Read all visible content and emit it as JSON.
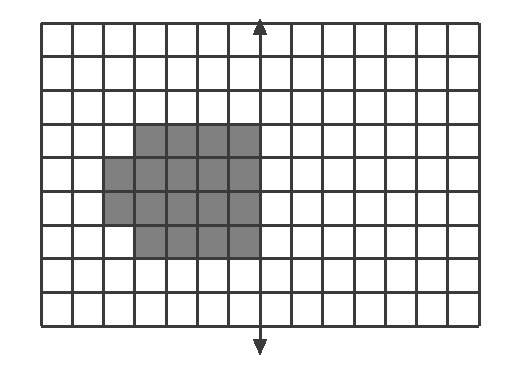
{
  "figure": {
    "caption_fragment": "",
    "grid": {
      "columns": 14,
      "rows": 9,
      "cell_width": 31.3,
      "cell_height": 33.7,
      "origin_x": 41,
      "origin_y": 23,
      "line_color": "#3a3a3a",
      "line_width": 3,
      "background_color": "#ffffff"
    },
    "shaded": {
      "fill_color": "#808080",
      "label": "shaded-region",
      "cells": [
        {
          "col": 3,
          "row": 3
        },
        {
          "col": 4,
          "row": 3
        },
        {
          "col": 5,
          "row": 3
        },
        {
          "col": 6,
          "row": 3
        },
        {
          "col": 2,
          "row": 4
        },
        {
          "col": 3,
          "row": 4
        },
        {
          "col": 4,
          "row": 4
        },
        {
          "col": 5,
          "row": 4
        },
        {
          "col": 6,
          "row": 4
        },
        {
          "col": 2,
          "row": 5
        },
        {
          "col": 3,
          "row": 5
        },
        {
          "col": 4,
          "row": 5
        },
        {
          "col": 5,
          "row": 5
        },
        {
          "col": 6,
          "row": 5
        },
        {
          "col": 3,
          "row": 6
        },
        {
          "col": 4,
          "row": 6
        },
        {
          "col": 5,
          "row": 6
        },
        {
          "col": 6,
          "row": 6
        }
      ],
      "cell_count": 18
    },
    "axis": {
      "label": "vertical-axis",
      "column_index": 7,
      "x": 260,
      "top_y": 18,
      "bottom_y": 356,
      "color": "#3a3a3a",
      "stroke_width": 3,
      "arrow_up": {
        "name": "arrow-up",
        "tip_y": 18
      },
      "arrow_down": {
        "name": "arrow-down",
        "tip_y": 356
      }
    }
  },
  "chart_data": {
    "type": "heatmap",
    "xlabel": "",
    "ylabel": "",
    "columns": 14,
    "rows": 9,
    "xlim": [
      0,
      14
    ],
    "ylim": [
      0,
      9
    ],
    "grid": true,
    "legend": "none",
    "colors": {
      "shaded": "#808080",
      "unshaded": "#ffffff",
      "gridline": "#3a3a3a"
    },
    "annotations": [
      {
        "type": "arrow",
        "name": "vertical-axis-arrow",
        "x": 7,
        "y0": 9.2,
        "y1": -0.4,
        "double_headed": true
      }
    ],
    "values": [
      [
        0,
        0,
        0,
        0,
        0,
        0,
        0,
        0,
        0,
        0,
        0,
        0,
        0,
        0
      ],
      [
        0,
        0,
        0,
        0,
        0,
        0,
        0,
        0,
        0,
        0,
        0,
        0,
        0,
        0
      ],
      [
        0,
        0,
        0,
        0,
        0,
        0,
        0,
        0,
        0,
        0,
        0,
        0,
        0,
        0
      ],
      [
        0,
        0,
        0,
        1,
        1,
        1,
        1,
        0,
        0,
        0,
        0,
        0,
        0,
        0
      ],
      [
        0,
        0,
        1,
        1,
        1,
        1,
        1,
        0,
        0,
        0,
        0,
        0,
        0,
        0
      ],
      [
        0,
        0,
        1,
        1,
        1,
        1,
        1,
        0,
        0,
        0,
        0,
        0,
        0,
        0
      ],
      [
        0,
        0,
        0,
        1,
        1,
        1,
        1,
        0,
        0,
        0,
        0,
        0,
        0,
        0
      ],
      [
        0,
        0,
        0,
        0,
        0,
        0,
        0,
        0,
        0,
        0,
        0,
        0,
        0,
        0
      ],
      [
        0,
        0,
        0,
        0,
        0,
        0,
        0,
        0,
        0,
        0,
        0,
        0,
        0,
        0
      ]
    ],
    "shaded_cell_count": 18,
    "total_cell_count": 126
  }
}
